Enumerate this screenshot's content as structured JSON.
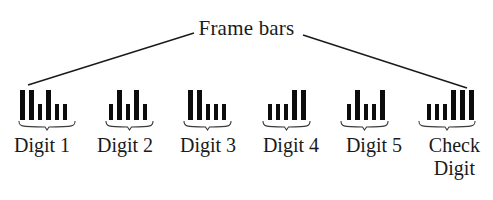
{
  "figure": {
    "title": "Frame bars",
    "background_color": "#ffffff",
    "bar_color": "#0c0c0c",
    "line_color": "#1a1a1a"
  },
  "annotation": {
    "label": "Frame bars",
    "leader_left": {
      "x1": 194,
      "y1": 33,
      "x2": 28,
      "y2": 85
    },
    "leader_right": {
      "x1": 303,
      "y1": 35,
      "x2": 467,
      "y2": 88
    }
  },
  "groups": [
    {
      "id": "digit-1",
      "label": "Digit 1",
      "bars": [
        {
          "height": "tall",
          "width": "wide"
        },
        {
          "height": "tall",
          "width": "wide"
        },
        {
          "height": "short",
          "width": "narrow"
        },
        {
          "height": "tall",
          "width": "wide"
        },
        {
          "height": "short",
          "width": "narrow"
        },
        {
          "height": "short",
          "width": "narrow"
        }
      ]
    },
    {
      "id": "digit-2",
      "label": "Digit 2",
      "bars": [
        {
          "height": "short",
          "width": "narrow"
        },
        {
          "height": "tall",
          "width": "wide"
        },
        {
          "height": "short",
          "width": "narrow"
        },
        {
          "height": "tall",
          "width": "wide"
        },
        {
          "height": "short",
          "width": "narrow"
        }
      ]
    },
    {
      "id": "digit-3",
      "label": "Digit 3",
      "bars": [
        {
          "height": "tall",
          "width": "wide"
        },
        {
          "height": "tall",
          "width": "wide"
        },
        {
          "height": "short",
          "width": "narrow"
        },
        {
          "height": "short",
          "width": "narrow"
        },
        {
          "height": "short",
          "width": "narrow"
        }
      ]
    },
    {
      "id": "digit-4",
      "label": "Digit 4",
      "bars": [
        {
          "height": "short",
          "width": "narrow"
        },
        {
          "height": "short",
          "width": "narrow"
        },
        {
          "height": "short",
          "width": "narrow"
        },
        {
          "height": "tall",
          "width": "wide"
        },
        {
          "height": "tall",
          "width": "wide"
        }
      ]
    },
    {
      "id": "digit-5",
      "label": "Digit 5",
      "bars": [
        {
          "height": "short",
          "width": "narrow"
        },
        {
          "height": "tall",
          "width": "wide"
        },
        {
          "height": "short",
          "width": "narrow"
        },
        {
          "height": "short",
          "width": "narrow"
        },
        {
          "height": "tall",
          "width": "wide"
        }
      ]
    },
    {
      "id": "check-digit",
      "label": "Check\nDigit",
      "bars": [
        {
          "height": "short",
          "width": "narrow"
        },
        {
          "height": "short",
          "width": "narrow"
        },
        {
          "height": "short",
          "width": "narrow"
        },
        {
          "height": "tall",
          "width": "wide"
        },
        {
          "height": "tall",
          "width": "wide"
        },
        {
          "height": "tall",
          "width": "wide"
        }
      ]
    }
  ]
}
